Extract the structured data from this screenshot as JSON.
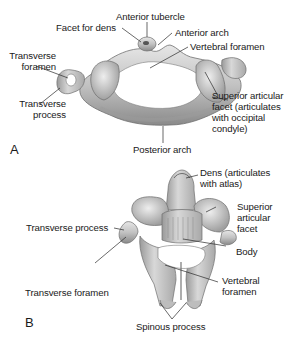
{
  "figure": {
    "panel_a": {
      "panel_label": "A",
      "structure": "Atlas (C1) vertebra, superior view",
      "labels": {
        "anterior_tubercle": "Anterior tubercle",
        "facet_for_dens": "Facet for dens",
        "anterior_arch": "Anterior arch",
        "vertebral_foramen": "Vertebral foramen",
        "transverse_foramen_1": "Transverse",
        "transverse_foramen_2": "foramen",
        "transverse_process_1": "Transverse",
        "transverse_process_2": "process",
        "superior_articular_facet_1": "Superior articular",
        "superior_articular_facet_2": "facet (articulates",
        "superior_articular_facet_3": "with occipital",
        "superior_articular_facet_4": "condyle)",
        "posterior_arch": "Posterior arch"
      }
    },
    "panel_b": {
      "panel_label": "B",
      "structure": "Axis (C2) vertebra, posterosuperior view",
      "labels": {
        "dens_1": "Dens (articulates",
        "dens_2": "with atlas)",
        "superior_articular_facet_1": "Superior",
        "superior_articular_facet_2": "articular",
        "superior_articular_facet_3": "facet",
        "transverse_process": "Transverse process",
        "body": "Body",
        "transverse_foramen": "Transverse foramen",
        "vertebral_foramen_1": "Vertebral",
        "vertebral_foramen_2": "foramen",
        "spinous_process": "Spinous process"
      }
    },
    "colors": {
      "bone_fill": "#c8c8c8",
      "bone_shadow": "#8f8f8f",
      "bone_highlight": "#ececec",
      "leader_line": "#2a2a2a",
      "text": "#1a1a1a"
    }
  }
}
